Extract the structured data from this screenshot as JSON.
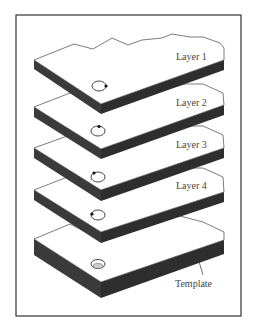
{
  "diagram": {
    "type": "exploded-layer-stack",
    "layers": [
      {
        "label": "Layer 1",
        "hole_mark": "right"
      },
      {
        "label": "Layer 2",
        "hole_mark": "top"
      },
      {
        "label": "Layer 3",
        "hole_mark": "top-left"
      },
      {
        "label": "Layer 4",
        "hole_mark": "left"
      }
    ],
    "template": {
      "label": "Template",
      "hole": "recessed"
    },
    "colors": {
      "edge": "#3a3a3a",
      "surface": "#ffffff",
      "frame": "#333333"
    }
  }
}
